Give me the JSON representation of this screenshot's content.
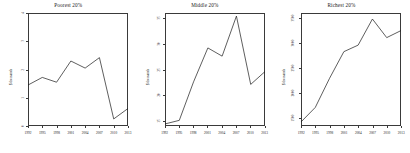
{
  "chart_data": [
    {
      "type": "line",
      "title": "Poorest 20%",
      "xlabel": "",
      "ylabel": "$ thousands",
      "categories": [
        "1992",
        "1995",
        "1998",
        "2001",
        "2004",
        "2007",
        "2010",
        "2013"
      ],
      "x": [
        1992,
        1995,
        1998,
        2001,
        2004,
        2007,
        2010,
        2013
      ],
      "values": [
        1.45,
        1.72,
        1.55,
        2.3,
        2.05,
        2.42,
        0.25,
        0.62
      ],
      "ylim": [
        0,
        4
      ],
      "yticks": [
        0,
        1,
        2,
        3,
        4
      ],
      "ytick_labels": [
        "0",
        "1",
        "2",
        "3",
        "4"
      ],
      "grid": false,
      "legend": "none",
      "line_color": "#1a1a1a"
    },
    {
      "type": "line",
      "title": "Middle 20%",
      "xlabel": "",
      "ylabel": "$ thousands",
      "categories": [
        "1992",
        "1995",
        "1998",
        "2001",
        "2004",
        "2007",
        "2010",
        "2013"
      ],
      "x": [
        1992,
        1995,
        1998,
        2001,
        2004,
        2007,
        2010,
        2013
      ],
      "values": [
        14.4,
        15.1,
        22.6,
        29.2,
        27.6,
        35.4,
        22.1,
        24.6
      ],
      "ylim": [
        14,
        36
      ],
      "yticks": [
        15,
        20,
        25,
        30,
        35
      ],
      "ytick_labels": [
        "15",
        "20",
        "25",
        "30",
        "35"
      ],
      "grid": false,
      "legend": "none",
      "line_color": "#1a1a1a"
    },
    {
      "type": "line",
      "title": "Richest 20%",
      "xlabel": "",
      "ylabel": "$ thousands",
      "categories": [
        "1992",
        "1995",
        "1998",
        "2001",
        "2004",
        "2007",
        "2010",
        "2013"
      ],
      "x": [
        1992,
        1995,
        1998,
        2001,
        2004,
        2007,
        2010,
        2013
      ],
      "values": [
        1430,
        1720,
        2300,
        2830,
        2960,
        3480,
        3110,
        3250
      ],
      "ylim": [
        1350,
        3600
      ],
      "yticks": [
        1500,
        2000,
        2500,
        3000,
        3500
      ],
      "ytick_labels": [
        "1500",
        "2000",
        "2500",
        "3000",
        "3500"
      ],
      "grid": false,
      "legend": "none",
      "line_color": "#1a1a1a"
    }
  ]
}
